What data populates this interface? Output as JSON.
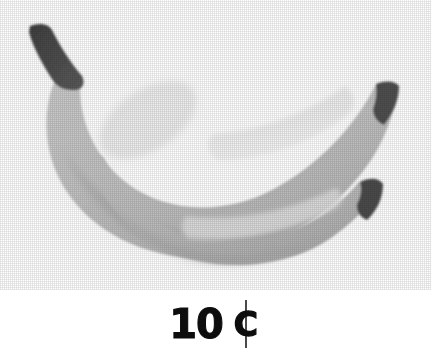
{
  "card": {
    "label": "banana price card",
    "background": "#ffffff"
  },
  "illustration": {
    "name": "two-bananas-illustration",
    "subject": "bananas",
    "count": 2,
    "style": "grayscale halftone scan",
    "alt_text": "Two overlapping bananas, grayscale",
    "colors": {
      "body_back": "#c6c6c6",
      "body_back_shadow": "#b0b0b0",
      "body_front": "#bdbdbd",
      "body_front_shadow": "#a9a9a9",
      "highlight": "#e3e3e3",
      "highlight_soft": "#d6d6d6",
      "stem": "#4a4a4a",
      "tip": "#4f4f4f",
      "outline": "#b6b6b6",
      "background": "#ffffff"
    }
  },
  "price": {
    "amount": "10",
    "unit_symbol": "¢",
    "unit_letter": "C",
    "full_text": "10 ¢",
    "color": "#0d0d0d"
  }
}
